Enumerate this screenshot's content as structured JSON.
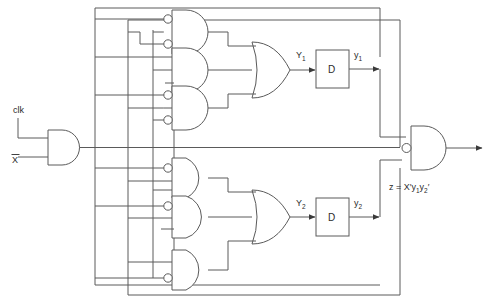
{
  "diagram": {
    "type": "logic-circuit-schematic",
    "line_color": "#5a5a5a",
    "text_color": "#2b2b2b",
    "background": "#ffffff"
  },
  "inputs": {
    "clk_label": "clk",
    "x_label": "X",
    "x_has_overbar": true
  },
  "flipflops": [
    {
      "id": "ff1",
      "box_label": "D",
      "input_label": "Y",
      "input_sub": "1",
      "output_label": "y",
      "output_sub": "1"
    },
    {
      "id": "ff2",
      "box_label": "D",
      "input_label": "Y",
      "input_sub": "2",
      "output_label": "y",
      "output_sub": "2"
    }
  ],
  "output": {
    "equation_prefix": "z = X",
    "equation_prime1": "′",
    "equation_y1": "y",
    "equation_y1_sub": "1",
    "equation_y2": "y",
    "equation_y2_sub": "2",
    "equation_prime2": "′",
    "equation_plain": "z = X'y1y2'"
  },
  "gates": {
    "input_and": {
      "name": "clk-x-and-gate",
      "type": "AND",
      "inputs": 2
    },
    "and_1": {
      "name": "and-gate-1",
      "type": "AND",
      "inputs": 3,
      "bubbles": [
        0,
        1
      ]
    },
    "and_2": {
      "name": "and-gate-2",
      "type": "AND",
      "inputs": 3,
      "bubbles": []
    },
    "and_3": {
      "name": "and-gate-3",
      "type": "AND",
      "inputs": 3,
      "bubbles": [
        1,
        2
      ]
    },
    "or_1": {
      "name": "or-gate-1",
      "type": "OR",
      "inputs": 3
    },
    "and_4": {
      "name": "and-gate-4",
      "type": "AND",
      "inputs": 3,
      "bubbles": [
        0
      ]
    },
    "and_5": {
      "name": "and-gate-5",
      "type": "AND",
      "inputs": 3,
      "bubbles": [
        0
      ]
    },
    "and_6": {
      "name": "and-gate-6",
      "type": "AND",
      "inputs": 2,
      "bubbles": [
        1
      ]
    },
    "or_2": {
      "name": "or-gate-2",
      "type": "OR",
      "inputs": 3
    },
    "output_and": {
      "name": "output-and-gate",
      "type": "AND",
      "inputs": 3,
      "bubbles": [
        1
      ]
    }
  }
}
